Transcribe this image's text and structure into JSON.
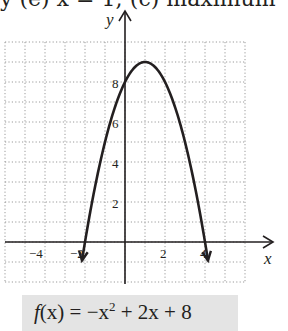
{
  "header": {
    "partial_text": "y (e) x = 1; (c) maximum"
  },
  "chart_data": {
    "type": "line",
    "title": "",
    "function": "f(x) = -x^2 + 2x + 8",
    "xlabel": "x",
    "ylabel": "y",
    "xlim": [
      -6,
      6
    ],
    "ylim": [
      -2,
      10
    ],
    "grid": true,
    "grid_style": "dotted",
    "x_ticks": [
      -4,
      -2,
      2,
      4
    ],
    "y_ticks": [
      2,
      4,
      6,
      8
    ],
    "x_tick_labels": [
      "−4",
      "−2",
      "2",
      "4"
    ],
    "y_tick_labels": [
      "2",
      "4",
      "6",
      "8"
    ],
    "vertex": [
      1,
      9
    ],
    "x_intercepts": [
      -2,
      4
    ],
    "y_intercept": 8,
    "series": [
      {
        "name": "f(x)",
        "x": [
          -2.2,
          -2,
          -1.5,
          -1,
          -0.5,
          0,
          0.5,
          1,
          1.5,
          2,
          2.5,
          3,
          3.5,
          4,
          4.2
        ],
        "values": [
          -1.24,
          0,
          2.75,
          5,
          6.75,
          8,
          8.75,
          9,
          8.75,
          8,
          6.75,
          5,
          2.75,
          0,
          -1.24
        ]
      }
    ],
    "arrows_on_ends": true
  },
  "equation": {
    "f": "f",
    "x_paren": "(x)",
    "rest": " = −x",
    "exp": "2",
    "tail": " + 2x + 8"
  },
  "colors": {
    "curve": "#231f20",
    "grid": "#9a9a9a",
    "equation_box": "#e4e4e4"
  }
}
